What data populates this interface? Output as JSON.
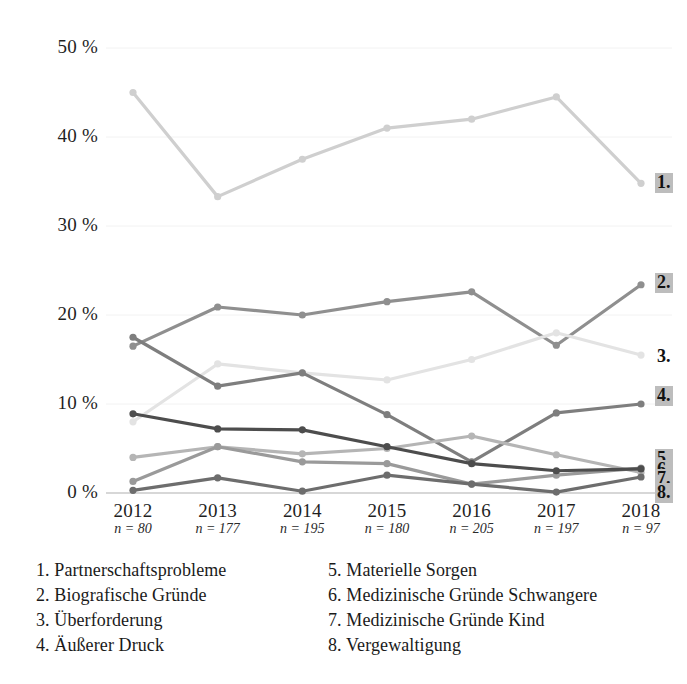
{
  "chart_data": {
    "type": "line",
    "title": "",
    "subtitle": "",
    "xlabel": "",
    "ylabel": "",
    "ylim": [
      0,
      50
    ],
    "ytick_labels": [
      "0 %",
      "10 %",
      "20 %",
      "30 %",
      "40 %",
      "50 %"
    ],
    "yticks": [
      0,
      10,
      20,
      30,
      40,
      50
    ],
    "grid": true,
    "legend_position": "below",
    "categories": [
      "2012",
      "2013",
      "2014",
      "2015",
      "2016",
      "2017",
      "2018"
    ],
    "sample_sizes": [
      "n = 80",
      "n = 177",
      "n = 195",
      "n = 180",
      "n = 205",
      "n = 197",
      "n = 97"
    ],
    "series": [
      {
        "key": "1",
        "number": "1.",
        "name": "Partnerschaftsprobleme",
        "color": "#cfcfcf",
        "values": [
          45.0,
          33.3,
          37.5,
          41.0,
          42.0,
          44.5,
          34.8
        ],
        "end_label": "1.",
        "end_label_boxed": true
      },
      {
        "key": "2",
        "number": "2.",
        "name": "Biografische Gründe",
        "color": "#8f8f8f",
        "values": [
          16.5,
          20.9,
          20.0,
          21.5,
          22.6,
          16.6,
          23.4
        ],
        "end_label": "2.",
        "end_label_boxed": true
      },
      {
        "key": "3",
        "number": "3.",
        "name": "Überforderung",
        "color": "#e3e3e3",
        "values": [
          8.0,
          14.5,
          13.5,
          12.7,
          15.0,
          18.0,
          15.5
        ],
        "end_label": "3.",
        "end_label_boxed": false
      },
      {
        "key": "4",
        "number": "4.",
        "name": "Äußerer Druck",
        "color": "#7e7e7e",
        "values": [
          17.5,
          12.0,
          13.5,
          8.8,
          3.5,
          9.0,
          10.0
        ],
        "end_label": "4.",
        "end_label_boxed": true
      },
      {
        "key": "5",
        "number": "5.",
        "name": "Materielle Sorgen",
        "color": "#b5b5b5",
        "values": [
          4.0,
          5.2,
          4.4,
          5.0,
          6.4,
          4.3,
          2.3
        ],
        "end_label": "5.",
        "end_label_boxed": true
      },
      {
        "key": "6",
        "number": "6.",
        "name": "Medizinische Gründe Schwangere",
        "color": "#9a9a9a",
        "values": [
          1.3,
          5.2,
          3.5,
          3.3,
          1.0,
          2.0,
          2.8
        ],
        "end_label": "6.",
        "end_label_boxed": true
      },
      {
        "key": "7",
        "number": "7.",
        "name": "Medizinische Gründe Kind",
        "color": "#4d4d4d",
        "values": [
          8.9,
          7.2,
          7.1,
          5.2,
          3.3,
          2.5,
          2.7
        ],
        "end_label": "7.",
        "end_label_boxed": true
      },
      {
        "key": "8",
        "number": "8.",
        "name": "Vergewaltigung",
        "color": "#6d6d6d",
        "values": [
          0.3,
          1.7,
          0.2,
          2.0,
          1.0,
          0.1,
          1.8
        ],
        "end_label": "8.",
        "end_label_boxed": true
      }
    ]
  },
  "legend": {
    "left_column": [
      {
        "num": "1.",
        "label": "Partnerschaftsprobleme"
      },
      {
        "num": "2.",
        "label": "Biografische Gründe"
      },
      {
        "num": "3.",
        "label": "Überforderung"
      },
      {
        "num": "4.",
        "label": "Äußerer Druck"
      }
    ],
    "right_column": [
      {
        "num": "5.",
        "label": "Materielle Sorgen"
      },
      {
        "num": "6.",
        "label": "Medizinische Gründe Schwangere"
      },
      {
        "num": "7.",
        "label": "Medizinische Gründe Kind"
      },
      {
        "num": "8.",
        "label": "Vergewaltigung"
      }
    ]
  }
}
